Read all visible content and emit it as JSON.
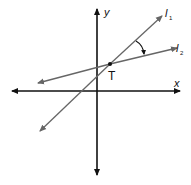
{
  "diagram": {
    "axes": {
      "x_label": "x",
      "y_label": "y"
    },
    "lines": [
      {
        "name": "l",
        "subscript": "1",
        "from": [
          40,
          131
        ],
        "to": [
          162,
          17
        ]
      },
      {
        "name": "l",
        "subscript": "2",
        "from": [
          38,
          83
        ],
        "to": [
          176,
          49
        ]
      }
    ],
    "point": {
      "label": "T",
      "at": [
        110,
        64
      ]
    },
    "angle_marker": {
      "between": [
        "l1",
        "l2"
      ],
      "arrow": true
    },
    "colors": {
      "axes": "#111111",
      "lines": "#666666",
      "point": "#111111"
    }
  }
}
